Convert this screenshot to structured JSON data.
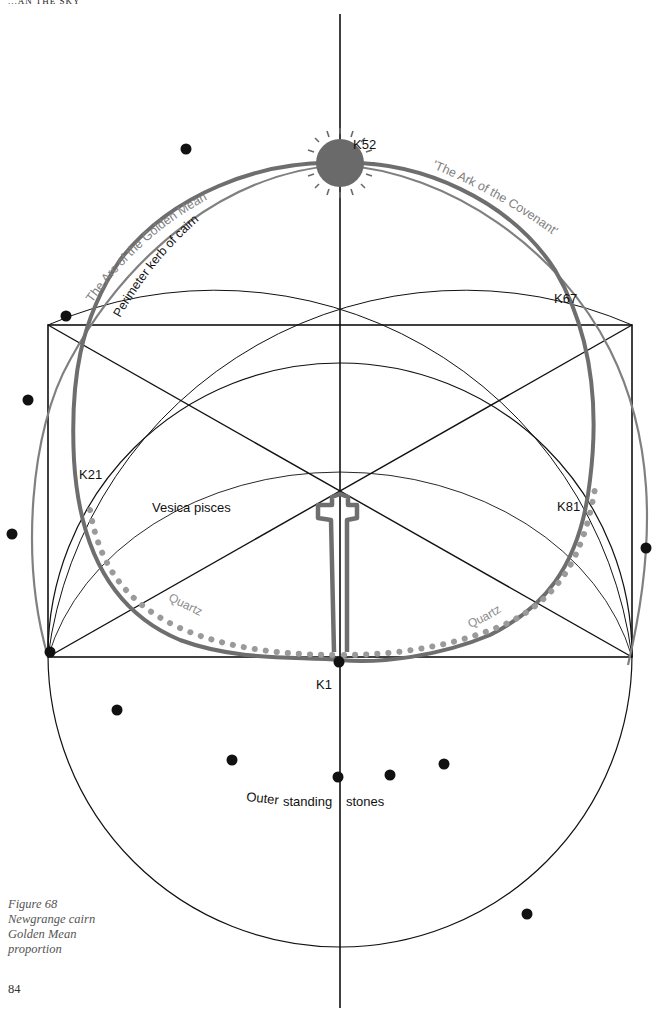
{
  "page": {
    "running_head": "...AN THE SKY",
    "page_number": "84"
  },
  "caption": {
    "line1": "Figure 68",
    "line2": "Newgrange cairn",
    "line3": "Golden Mean",
    "line4": "proportion"
  },
  "labels": {
    "k52": "K52",
    "k67": "K67",
    "k21": "K21",
    "k81": "K81",
    "k1": "K1",
    "vesica": "Vesica pisces",
    "quartz_left": "Quartz",
    "quartz_right": "Quartz",
    "arc_golden_mean": "The Arc of the Golden Mean",
    "ark_covenant": "'The Ark of the Covenant'",
    "perimeter_kerb": "Perimeter kerb of cairn",
    "outer_stones_1": "Outer",
    "outer_stones_2": "standing",
    "outer_stones_3": "stones"
  },
  "colors": {
    "line": "#111111",
    "kerb": "#6e6e6e",
    "arc": "#808080",
    "quartz": "#9a9a9a",
    "sun": "#6a6a6a",
    "stone": "#111111"
  },
  "standing_stones": [
    {
      "x": 186,
      "y": 149
    },
    {
      "x": 66,
      "y": 316
    },
    {
      "x": 28,
      "y": 400
    },
    {
      "x": 12,
      "y": 534
    },
    {
      "x": 646,
      "y": 548
    },
    {
      "x": 117,
      "y": 710
    },
    {
      "x": 232,
      "y": 760
    },
    {
      "x": 338,
      "y": 777
    },
    {
      "x": 390,
      "y": 775
    },
    {
      "x": 444,
      "y": 764
    },
    {
      "x": 527,
      "y": 914
    }
  ]
}
